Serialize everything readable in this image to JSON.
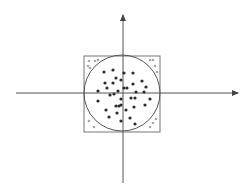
{
  "diagram": {
    "type": "monte-carlo-pi-estimation",
    "colors": {
      "background": "#ffffff",
      "axis": "#555555",
      "square": "#777777",
      "circle": "#555555",
      "inside_point": "#2b2b2b",
      "outside_point": "#a8a8a8"
    },
    "axes": {
      "x": {
        "x1": 16,
        "y": 93,
        "x2": 238
      },
      "y": {
        "x": 123,
        "y1": 183,
        "y2": 15
      }
    },
    "square": {
      "x": 84,
      "y": 56,
      "size": 76
    },
    "circle": {
      "cx": 122,
      "cy": 93,
      "r": 38
    },
    "inside_points": [
      [
        104,
        72
      ],
      [
        113,
        70
      ],
      [
        124,
        73
      ],
      [
        133,
        73
      ],
      [
        116,
        78
      ],
      [
        121,
        80
      ],
      [
        105,
        83
      ],
      [
        113,
        83
      ],
      [
        133,
        84
      ],
      [
        142,
        81
      ],
      [
        107,
        88
      ],
      [
        124,
        88
      ],
      [
        127,
        88
      ],
      [
        146,
        87
      ],
      [
        98,
        91
      ],
      [
        118,
        91
      ],
      [
        110,
        95
      ],
      [
        114,
        94
      ],
      [
        136,
        92
      ],
      [
        144,
        92
      ],
      [
        121,
        99
      ],
      [
        131,
        98
      ],
      [
        135,
        98
      ],
      [
        150,
        99
      ],
      [
        98,
        101
      ],
      [
        116,
        106
      ],
      [
        119,
        106
      ],
      [
        121,
        105
      ],
      [
        134,
        107
      ],
      [
        145,
        105
      ],
      [
        106,
        110
      ],
      [
        126,
        110
      ],
      [
        117,
        113
      ],
      [
        109,
        117
      ],
      [
        130,
        118
      ],
      [
        121,
        121
      ],
      [
        135,
        124
      ]
    ],
    "outside_points": [
      [
        89,
        61
      ],
      [
        95,
        61
      ],
      [
        98,
        60
      ],
      [
        88,
        66
      ],
      [
        90,
        68
      ],
      [
        150,
        60
      ],
      [
        153,
        60
      ],
      [
        155,
        66
      ],
      [
        157,
        72
      ],
      [
        89,
        121
      ],
      [
        94,
        127
      ],
      [
        156,
        119
      ],
      [
        153,
        123
      ],
      [
        150,
        127
      ]
    ]
  }
}
